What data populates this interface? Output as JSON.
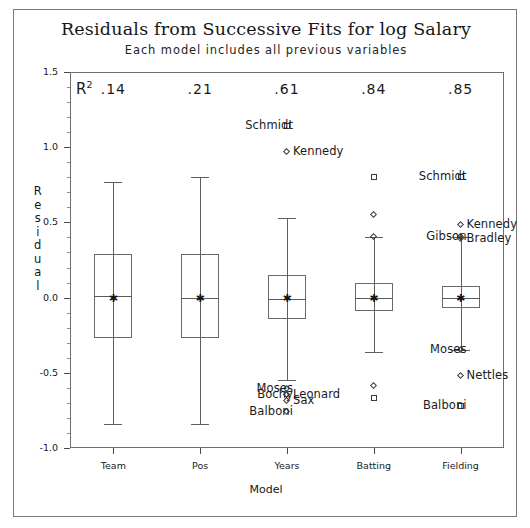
{
  "figure": {
    "title": "Residuals from Successive Fits for log Salary",
    "subtitle": "Each model includes all previous variables",
    "r2_header": "R",
    "r2_exponent": "2"
  },
  "chart_data": {
    "type": "boxplot",
    "title": "Residuals from Successive Fits for log Salary",
    "subtitle": "Each model includes all previous variables",
    "xlabel": "Model",
    "ylabel": "Residual",
    "ylim": [
      -1.0,
      1.5
    ],
    "ytick_labels": [
      "1.5",
      "1.0",
      "0.5",
      "0.0",
      "-0.5",
      "-1.0"
    ],
    "ytick_values": [
      1.5,
      1.0,
      0.5,
      0.0,
      -0.5,
      -1.0
    ],
    "minor_tick_step": 0.1,
    "grid": false,
    "legend": "none",
    "categories": [
      "Team",
      "Pos",
      "Years",
      "Batting",
      "Fielding"
    ],
    "r2_values": [
      ".14",
      ".21",
      ".61",
      ".84",
      ".85"
    ],
    "boxes": [
      {
        "category": "Team",
        "whisker_low": -0.84,
        "q1": -0.27,
        "median": 0.01,
        "mean": 0.0,
        "q3": 0.29,
        "whisker_high": 0.77,
        "outliers": []
      },
      {
        "category": "Pos",
        "whisker_low": -0.84,
        "q1": -0.27,
        "median": 0.0,
        "mean": 0.0,
        "q3": 0.29,
        "whisker_high": 0.8,
        "outliers": []
      },
      {
        "category": "Years",
        "whisker_low": -0.55,
        "q1": -0.14,
        "median": -0.01,
        "mean": 0.0,
        "q3": 0.15,
        "whisker_high": 0.53,
        "outliers": [
          {
            "label": "Schmidt",
            "value": 1.14,
            "marker": "square",
            "label_side": "left"
          },
          {
            "label": "Kennedy",
            "value": 0.97,
            "marker": "diamond",
            "label_side": "right"
          },
          {
            "label": "Moses",
            "value": -0.61,
            "marker": "diamond",
            "label_side": "left"
          },
          {
            "label": "Bochy",
            "value": -0.65,
            "marker": "diamond",
            "label_side": "left"
          },
          {
            "label": "Leonard",
            "value": -0.65,
            "marker": "diamond",
            "label_side": "right"
          },
          {
            "label": "Sax",
            "value": -0.69,
            "marker": "diamond",
            "label_side": "right"
          },
          {
            "label": "Balboni",
            "value": -0.76,
            "marker": "diamond",
            "label_side": "left"
          }
        ]
      },
      {
        "category": "Batting",
        "whisker_low": -0.36,
        "q1": -0.09,
        "median": 0.0,
        "mean": 0.0,
        "q3": 0.1,
        "whisker_high": 0.4,
        "outliers": [
          {
            "label": "",
            "value": 0.8,
            "marker": "square",
            "label_side": "none"
          },
          {
            "label": "",
            "value": 0.55,
            "marker": "diamond",
            "label_side": "none"
          },
          {
            "label": "",
            "value": 0.4,
            "marker": "diamond",
            "label_side": "none"
          },
          {
            "label": "",
            "value": -0.59,
            "marker": "diamond",
            "label_side": "none"
          },
          {
            "label": "",
            "value": -0.67,
            "marker": "square",
            "label_side": "none"
          }
        ]
      },
      {
        "category": "Fielding",
        "whisker_low": -0.35,
        "q1": -0.07,
        "median": 0.0,
        "mean": 0.0,
        "q3": 0.08,
        "whisker_high": 0.4,
        "outliers": [
          {
            "label": "Schmidt",
            "value": 0.8,
            "marker": "square",
            "label_side": "left"
          },
          {
            "label": "Kennedy",
            "value": 0.48,
            "marker": "diamond",
            "label_side": "right"
          },
          {
            "label": "Gibson",
            "value": 0.4,
            "marker": "diamond",
            "label_side": "left"
          },
          {
            "label": "Bradley",
            "value": 0.39,
            "marker": "diamond",
            "label_side": "right"
          },
          {
            "label": "Moses",
            "value": -0.35,
            "marker": "diamond",
            "label_side": "left"
          },
          {
            "label": "Nettles",
            "value": -0.52,
            "marker": "diamond",
            "label_side": "right"
          },
          {
            "label": "Balboni",
            "value": -0.72,
            "marker": "square",
            "label_side": "left"
          }
        ]
      }
    ]
  }
}
